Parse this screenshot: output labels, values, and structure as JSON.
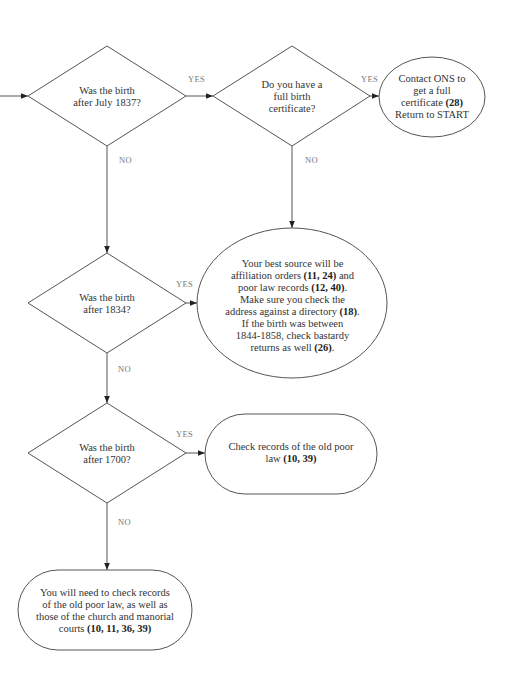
{
  "diagram": {
    "type": "flowchart",
    "decisions": [
      {
        "id": "d1",
        "line1": "Was the birth",
        "line2": "after July 1837?"
      },
      {
        "id": "d2",
        "line1": "Do you have a",
        "line2": "full birth",
        "line3": "certificate?"
      },
      {
        "id": "d3",
        "line1": "Was the birth",
        "line2": "after 1834?"
      },
      {
        "id": "d4",
        "line1": "Was the birth",
        "line2": "after 1700?"
      }
    ],
    "outcomes": {
      "ons": {
        "line1": "Contact  ONS to",
        "line2": "get a full",
        "line3_text": "certificate  ",
        "line3_ref": "(28)",
        "line4": "Return to START"
      },
      "best_source": {
        "line1": "Your best source will be",
        "line2_text": "affiliation orders  ",
        "line2_ref": "(11, 24)",
        "line2_tail": " and",
        "line3_text": "poor law records  ",
        "line3_ref": "(12, 40)",
        "line3_tail": ".",
        "line4": "Make sure you check the",
        "line5_text": "address against a directory  ",
        "line5_ref": "(18)",
        "line5_tail": ".",
        "line6": "If the birth was between",
        "line7": "1844-1858, check bastardy",
        "line8_text": "returns as well  ",
        "line8_ref": "(26)",
        "line8_tail": "."
      },
      "old_poor_law": {
        "line1": "Check records of the old poor",
        "line2_text": "law ",
        "line2_ref": "(10, 39)"
      },
      "church_manorial": {
        "line1": "You will need to check records",
        "line2": "of the old poor law, as well as",
        "line3": "those of the church and manorial",
        "line4_text": "courts  ",
        "line4_ref": "(10, 11, 36, 39)"
      }
    },
    "edge_labels": {
      "d1_yes": "YES",
      "d1_no": "NO",
      "d2_yes": "YES",
      "d2_no": "NO",
      "d3_yes": "YES",
      "d3_no": "NO",
      "d4_yes": "YES",
      "d4_no": "NO"
    },
    "colors": {
      "stroke": "#555555",
      "text": "#333333",
      "label": "#777777",
      "background": "#ffffff"
    }
  }
}
